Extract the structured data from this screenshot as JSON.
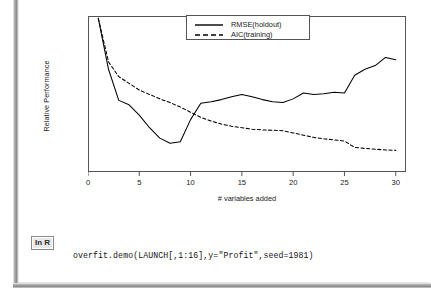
{
  "slide": {
    "inr_badge_label": "In R",
    "code_line": "overfit.demo(LAUNCH[,1:16],y=\"Profit\",seed=1981)"
  },
  "chart_data": {
    "type": "line",
    "title": "",
    "xlabel": "# variables added",
    "ylabel": "Relative Performance",
    "xlim": [
      0,
      31
    ],
    "ylim": [
      0,
      1
    ],
    "xticks": [
      0,
      5,
      10,
      15,
      20,
      25,
      30
    ],
    "xtick_labels": [
      "0",
      "5",
      "10",
      "15",
      "20",
      "25",
      "30"
    ],
    "yticks": [],
    "ytick_labels": [],
    "grid": false,
    "legend_position": "top-right",
    "x": [
      1,
      2,
      3,
      4,
      5,
      6,
      7,
      8,
      9,
      10,
      11,
      12,
      13,
      14,
      15,
      16,
      17,
      18,
      19,
      20,
      21,
      22,
      23,
      24,
      25,
      26,
      27,
      28,
      29,
      30
    ],
    "series": [
      {
        "name": "RMSE(holdout)",
        "style": "solid",
        "color": "#000000",
        "values": [
          0.985,
          0.64,
          0.43,
          0.4,
          0.33,
          0.245,
          0.175,
          0.14,
          0.15,
          0.3,
          0.41,
          0.42,
          0.435,
          0.455,
          0.47,
          0.455,
          0.435,
          0.42,
          0.415,
          0.44,
          0.48,
          0.47,
          0.475,
          0.485,
          0.48,
          0.6,
          0.64,
          0.665,
          0.72,
          0.705
        ]
      },
      {
        "name": "AIC(training)",
        "style": "dashed",
        "color": "#000000",
        "values": [
          0.985,
          0.69,
          0.59,
          0.545,
          0.5,
          0.47,
          0.44,
          0.415,
          0.385,
          0.35,
          0.315,
          0.29,
          0.27,
          0.255,
          0.245,
          0.235,
          0.23,
          0.228,
          0.225,
          0.21,
          0.195,
          0.18,
          0.17,
          0.163,
          0.155,
          0.112,
          0.105,
          0.1,
          0.095,
          0.092
        ]
      }
    ]
  }
}
